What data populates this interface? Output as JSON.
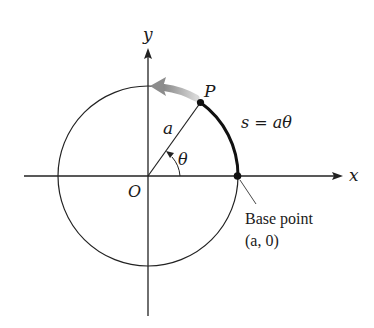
{
  "diagram": {
    "axes": {
      "x_label": "x",
      "y_label": "y",
      "origin_label": "O"
    },
    "circle": {
      "center": [
        148,
        176
      ],
      "radius": 90,
      "stroke": "#222222"
    },
    "radius_label": "a",
    "angle_label": "θ",
    "point_P_label": "P",
    "arc_label": "s = aθ",
    "base_point": {
      "label_line1": "Base point",
      "label_line2": "(a, 0)"
    },
    "direction_arrow": {
      "meaning": "counterclockwise motion",
      "color": "#9a9a9a"
    },
    "colors": {
      "ink": "#1a1a1a",
      "arrow_gray": "#a0a0a0",
      "background": "#ffffff"
    }
  }
}
